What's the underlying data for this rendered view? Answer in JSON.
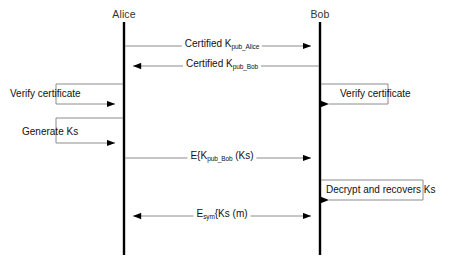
{
  "diagram": {
    "background_color": "#ffffff",
    "line_color": "#8c8c8c",
    "lifeline_color": "#000000",
    "text_color": "#111111",
    "actors": [
      {
        "id": "alice",
        "label": "Alice",
        "x": 124,
        "top": 22,
        "bottom": 255
      },
      {
        "id": "bob",
        "label": "Bob",
        "x": 320,
        "top": 22,
        "bottom": 255
      }
    ],
    "messages": [
      {
        "id": "certified-kpub-alice",
        "label_prefix": "Certified K",
        "label_sub": "pub_Alice",
        "label_suffix": "",
        "direction": "alice-to-bob",
        "y": 46,
        "arrowheads": "right"
      },
      {
        "id": "certified-kpub-bob",
        "label_prefix": "Certified K",
        "label_sub": "pub_Bob",
        "label_suffix": "",
        "direction": "bob-to-alice",
        "y": 66,
        "arrowheads": "left"
      },
      {
        "id": "encrypt-session-key",
        "label_prefix": "E{K",
        "label_sub": "pub_Bob",
        "label_suffix": " (Ks)",
        "direction": "alice-to-bob",
        "y": 158,
        "arrowheads": "right"
      },
      {
        "id": "symmetric-message",
        "label_prefix": "E",
        "label_sub": "sym",
        "label_suffix": "{Ks (m)",
        "direction": "both",
        "y": 216,
        "arrowheads": "both"
      }
    ],
    "self_actions": [
      {
        "id": "alice-verify-certificate",
        "label": "Verify certificate",
        "actor": "alice",
        "side": "left",
        "top_y": 84,
        "bottom_y": 104,
        "extent": 68,
        "label_x": 10,
        "label_y": 88
      },
      {
        "id": "bob-verify-certificate",
        "label": "Verify certificate",
        "actor": "bob",
        "side": "right",
        "top_y": 84,
        "bottom_y": 104,
        "extent": 68,
        "label_x": 340,
        "label_y": 88
      },
      {
        "id": "alice-generate-ks",
        "label": "Generate Ks",
        "actor": "alice",
        "side": "left",
        "top_y": 118,
        "bottom_y": 143,
        "extent": 68,
        "label_x": 22,
        "label_y": 126
      },
      {
        "id": "bob-decrypt-recovers-ks",
        "label": "Decrypt and recovers Ks",
        "actor": "bob",
        "side": "right",
        "top_y": 180,
        "bottom_y": 200,
        "extent": 103,
        "label_x": 326,
        "label_y": 184
      }
    ]
  }
}
